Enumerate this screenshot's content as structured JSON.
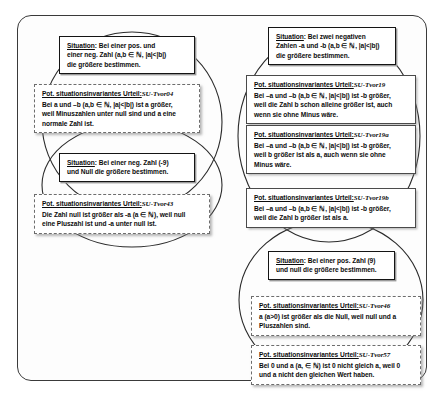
{
  "diagram": {
    "title_note": "",
    "groups": [
      {
        "id": "group-left-top",
        "situation": {
          "heading": "Situation",
          "lines": [
            ": Bei einer pos. und",
            "einer neg. Zahl (a,b ∈ ℕ, |a|<|b|)",
            "die größere bestimmen."
          ]
        },
        "judgements": [
          {
            "heading": "Pot. situationsinvariantes Urteil:",
            "code": "SU-Tvor04",
            "lines": [
              "Bei a und –b (a,b ∈ ℕ, |a|<|b|) ist a größer,",
              "weil Minuszahlen unter null sind und a eine",
              "normale Zahl ist."
            ]
          }
        ]
      },
      {
        "id": "group-left-bottom",
        "situation": {
          "heading": "Situation",
          "lines": [
            ": Bei einer neg. Zahl (-9)",
            "und Null die größere bestimmen."
          ]
        },
        "judgements": [
          {
            "heading": "Pot. situationsinvariantes Urteil:",
            "code": "SU-Tvor43",
            "lines": [
              "Die Zahl null ist größer als -a (a ∈ ℕ), weil null",
              "eine Pluszahl ist und -a unter null ist."
            ]
          }
        ]
      },
      {
        "id": "group-right-top",
        "situation": {
          "heading": "Situation",
          "lines": [
            ": Bei zwei negativen",
            "Zahlen -a und -b (a,b ∈ ℕ, |a|<|b|)",
            "die größere bestimmen."
          ]
        },
        "judgements": [
          {
            "heading": "Pot. situationsinvariantes Urteil:",
            "code": "SU-Tvor19",
            "lines": [
              "Bei –a und –b (a,b ∈ ℕ, |a|<|b|)  ist -b größer,",
              "weil die Zahl b schon alleine größer ist, auch",
              "wenn sie ohne Minus wäre."
            ]
          },
          {
            "heading": "Pot. situationsinvariantes Urteil:",
            "code": "SU-Tvor19a",
            "lines": [
              "Bei –a und –b (a,b ∈ ℕ, |a|<|b|)  ist -b größer,",
              "weil b größer ist als a, auch wenn sie ohne",
              "Minus wäre."
            ]
          },
          {
            "heading": "Pot. situationsinvariantes Urteil:",
            "code": "SU-Tvor19b",
            "lines": [
              "Bei –a und –b (a,b ∈ ℕ, |a|<|b|)  ist -b größer,",
              "weil die Zahl b größer ist als a."
            ]
          }
        ]
      },
      {
        "id": "group-right-bottom",
        "situation": {
          "heading": "Situation",
          "lines": [
            ": Bei einer pos. Zahl (9)",
            "und null die größere bestimmen."
          ]
        },
        "judgements": [
          {
            "heading": "Pot. situationsinvariantes Urteil:",
            "code": "SU-Tvor46",
            "lines": [
              "a (a>0) ist größer als die Null, weil null und a",
              "Pluszahlen sind."
            ]
          },
          {
            "heading": "Pot. situationsinvariantes Urteil:",
            "code": "SU-Tvor57",
            "lines": [
              "Bei 0 und a (a, ∈ ℕ)  ist 0 nicht gleich a, weil 0",
              "und a nicht den gleichen Wert haben."
            ]
          }
        ]
      }
    ],
    "colors": {
      "frame": "#3a3a3a",
      "situation_border": "#141414",
      "judgement_border": "#6d6d6d",
      "ellipse": "#2b2b2b",
      "text": "#0c0c0c",
      "background": "#ffffff"
    }
  }
}
